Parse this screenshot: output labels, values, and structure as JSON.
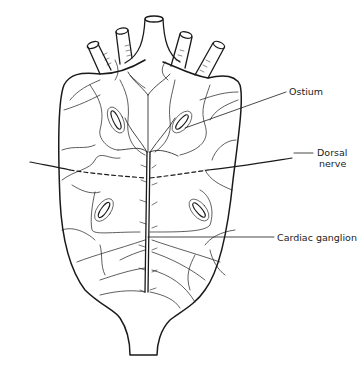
{
  "diagram": {
    "labels": {
      "ostium": "Ostium",
      "dorsal_nerve_line1": "Dorsal",
      "dorsal_nerve_line2": "nerve",
      "cardiac_ganglion": "Cardiac ganglion"
    },
    "colors": {
      "line": "#1a1a1a",
      "background": "#ffffff"
    }
  }
}
